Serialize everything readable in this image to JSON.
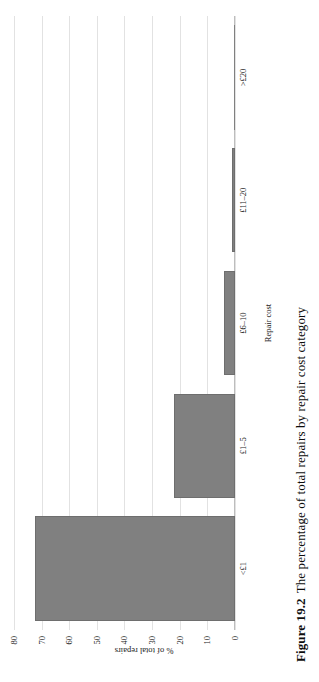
{
  "figure": {
    "number_label": "Figure 19.2",
    "caption_text": "The percentage of total repairs by repair cost category"
  },
  "chart_data": {
    "type": "bar",
    "title": "",
    "subtitle": "",
    "xlabel": "Repair cost",
    "ylabel": "% of total repairs",
    "categories": [
      "<£1",
      "£1–5",
      "£6–10",
      "£11–20",
      ">£20"
    ],
    "values": [
      72.5,
      22,
      4,
      1,
      0.3
    ],
    "ylim": [
      0,
      80
    ],
    "yticks": [
      0,
      10,
      20,
      30,
      40,
      50,
      60,
      70,
      80
    ],
    "ytick_labels": [
      "0",
      "10",
      "20",
      "30",
      "40",
      "50",
      "60",
      "70",
      "80"
    ],
    "grid": true,
    "legend": "none",
    "bar_color": "#808080",
    "bar_edge_color": "#6e6e6e",
    "gridline_color": "#e2e2e2",
    "axis_color": "#bdbdbd",
    "orientation": "vertical",
    "page_rotation_degrees": -90
  }
}
